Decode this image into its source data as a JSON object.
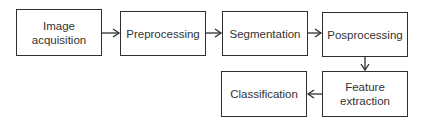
{
  "diagram": {
    "type": "flowchart",
    "nodes": [
      {
        "id": "image-acquisition",
        "label": "Image\nacquisition"
      },
      {
        "id": "preprocessing",
        "label": "Preprocessing"
      },
      {
        "id": "segmentation",
        "label": "Segmentation"
      },
      {
        "id": "posprocessing",
        "label": "Posprocessing"
      },
      {
        "id": "feature-extraction",
        "label": "Feature\nextraction"
      },
      {
        "id": "classification",
        "label": "Classification"
      }
    ],
    "edges": [
      {
        "from": "image-acquisition",
        "to": "preprocessing"
      },
      {
        "from": "preprocessing",
        "to": "segmentation"
      },
      {
        "from": "segmentation",
        "to": "posprocessing"
      },
      {
        "from": "posprocessing",
        "to": "feature-extraction"
      },
      {
        "from": "feature-extraction",
        "to": "classification"
      }
    ],
    "labels": {
      "image_acquisition_1": "Image",
      "image_acquisition_2": "acquisition",
      "preprocessing": "Preprocessing",
      "segmentation": "Segmentation",
      "posprocessing": "Posprocessing",
      "feature_extraction_1": "Feature",
      "feature_extraction_2": "extraction",
      "classification": "Classification"
    }
  }
}
